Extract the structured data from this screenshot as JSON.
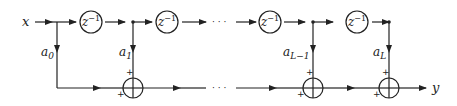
{
  "diagram": {
    "input_label": "x",
    "output_label": "y",
    "delay_label": "z",
    "delay_exponent": "−1",
    "ellipsis": "· · ·",
    "taps": [
      {
        "base": "a",
        "sub": "0"
      },
      {
        "base": "a",
        "sub": "1"
      },
      {
        "base": "a",
        "sub": "L−1"
      },
      {
        "base": "a",
        "sub": "L"
      }
    ],
    "adder_sign": "+",
    "colors": {
      "stroke": "#222222",
      "background": "#ffffff"
    }
  }
}
